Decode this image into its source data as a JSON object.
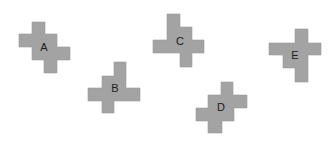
{
  "figure": {
    "width": 332,
    "height": 141,
    "background": "#ffffff",
    "shape_fill": "#a3a3a3",
    "shapes": [
      {
        "label": "A",
        "points": "32,22 45,22 45,34 57,34 57,47 70,47 70,60 57,60 57,73 44,73 44,60 32,60 32,47 19,47 19,34 32,34",
        "label_x": 44,
        "label_y": 48
      },
      {
        "label": "B",
        "points": "114,62 126,62 126,88 140,88 140,101 114,101 114,113 102,113 102,101 88,101 88,88 102,88 102,76 114,76",
        "label_x": 115,
        "label_y": 89
      },
      {
        "label": "C",
        "points": "167,14 180,14 180,27 192,27 192,40 204,40 204,53 192,53 192,67 180,67 180,53 153,53 153,40 167,40",
        "label_x": 180,
        "label_y": 42
      },
      {
        "label": "D",
        "points": "221,82 233,82 233,95 247,95 247,108 234,108 234,121 222,121 222,133 208,133 208,121 196,121 196,108 208,108 208,95 221,95",
        "label_x": 221,
        "label_y": 108
      },
      {
        "label": "E",
        "points": "295,29 308,29 308,43 321,43 321,55 308,55 308,82 295,82 295,68 283,68 283,55 269,55 269,43 295,43",
        "label_x": 295,
        "label_y": 56
      }
    ]
  }
}
